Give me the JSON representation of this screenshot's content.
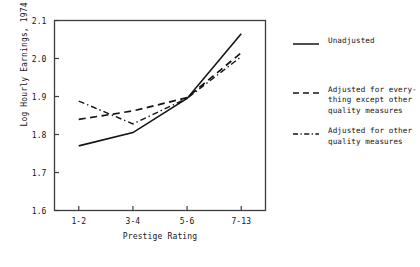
{
  "chart_data": {
    "type": "line",
    "title": "",
    "xlabel": "Prestige Rating",
    "ylabel": "Log Hourly Earnings, 1974",
    "categories": [
      "1-2",
      "3-4",
      "5-6",
      "7-13"
    ],
    "ylim": [
      1.6,
      2.1
    ],
    "yticks": [
      "1.6",
      "1.7",
      "1.8",
      "1.9",
      "2.0",
      "2.1"
    ],
    "ytick_values": [
      1.6,
      1.7,
      1.8,
      1.9,
      2.0,
      2.1
    ],
    "grid": false,
    "legend_position": "right",
    "series": [
      {
        "name": "Unadjusted",
        "style": "solid",
        "values": [
          1.77,
          1.805,
          1.895,
          2.065
        ]
      },
      {
        "name": "Adjusted for every-\nthing except other\nquality measures",
        "style": "dashed",
        "values": [
          1.84,
          1.862,
          1.897,
          2.015
        ]
      },
      {
        "name": "Adjusted for other\nquality measures",
        "style": "dash-dot",
        "values": [
          1.888,
          1.828,
          1.895,
          2.005
        ]
      }
    ]
  },
  "legend": {
    "items": [
      {
        "label": "Unadjusted",
        "sample": "solid-line-sample"
      },
      {
        "label": "Adjusted for every-\nthing except other\nquality measures",
        "sample": "dashed-line-sample"
      },
      {
        "label": "Adjusted for other\nquality measures",
        "sample": "dash-dot-line-sample"
      }
    ]
  },
  "colors": {
    "line": "#141414",
    "axis": "#3c3c3c",
    "background": "#ffffff"
  }
}
